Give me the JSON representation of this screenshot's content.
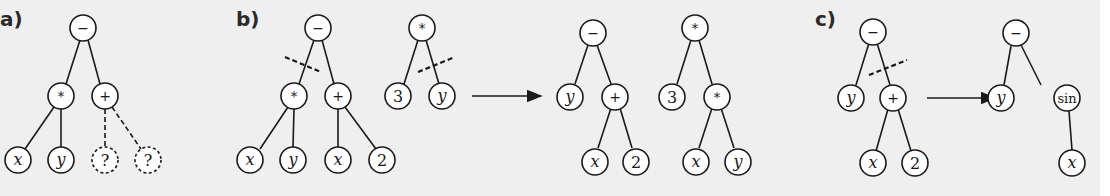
{
  "panels": [
    {
      "label": "a)",
      "description": "Expression tree with incomplete subtree (dashed placeholders)",
      "trees": [
        {
          "root": "−",
          "nodes": [
            {
              "id": "a1",
              "label": "−",
              "type": "operator"
            },
            {
              "id": "a2",
              "label": "*",
              "type": "operator"
            },
            {
              "id": "a3",
              "label": "+",
              "type": "operator"
            },
            {
              "id": "a4",
              "label": "x",
              "type": "variable"
            },
            {
              "id": "a5",
              "label": "y",
              "type": "variable"
            },
            {
              "id": "a6",
              "label": "?",
              "type": "placeholder"
            },
            {
              "id": "a7",
              "label": "?",
              "type": "placeholder"
            }
          ]
        }
      ]
    },
    {
      "label": "b)",
      "description": "Crossover: subtrees swapped at cut points",
      "before": [
        {
          "nodes": [
            {
              "id": "b1",
              "label": "−"
            },
            {
              "id": "b2",
              "label": "*"
            },
            {
              "id": "b3",
              "label": "+"
            },
            {
              "id": "b4",
              "label": "x"
            },
            {
              "id": "b5",
              "label": "y"
            },
            {
              "id": "b6",
              "label": "x"
            },
            {
              "id": "b7",
              "label": "2"
            }
          ]
        },
        {
          "nodes": [
            {
              "id": "b8",
              "label": "*"
            },
            {
              "id": "b9",
              "label": "3"
            },
            {
              "id": "b10",
              "label": "y"
            }
          ]
        }
      ],
      "after": [
        {
          "nodes": [
            {
              "id": "b11",
              "label": "−"
            },
            {
              "id": "b12",
              "label": "y"
            },
            {
              "id": "b13",
              "label": "+"
            },
            {
              "id": "b14",
              "label": "x"
            },
            {
              "id": "b15",
              "label": "2"
            }
          ]
        },
        {
          "nodes": [
            {
              "id": "b16",
              "label": "*"
            },
            {
              "id": "b17",
              "label": "3"
            },
            {
              "id": "b18",
              "label": "*"
            },
            {
              "id": "b19",
              "label": "x"
            },
            {
              "id": "b20",
              "label": "y"
            }
          ]
        }
      ]
    },
    {
      "label": "c)",
      "description": "Mutation: subtree replaced",
      "before": [
        {
          "nodes": [
            {
              "id": "c1",
              "label": "−"
            },
            {
              "id": "c2",
              "label": "y"
            },
            {
              "id": "c3",
              "label": "+"
            },
            {
              "id": "c4",
              "label": "x"
            },
            {
              "id": "c5",
              "label": "2"
            }
          ]
        }
      ],
      "after": [
        {
          "nodes": [
            {
              "id": "c6",
              "label": "−"
            },
            {
              "id": "c7",
              "label": "y"
            },
            {
              "id": "c8",
              "label": "sin"
            },
            {
              "id": "c9",
              "label": "x"
            }
          ]
        }
      ]
    }
  ],
  "labels": {
    "a": "a)",
    "b": "b)",
    "c": "c)",
    "a1": "−",
    "a2": "*",
    "a3": "+",
    "a4": "x",
    "a5": "y",
    "a6": "?",
    "a7": "?",
    "b1": "−",
    "b2": "*",
    "b3": "+",
    "b4": "x",
    "b5": "y",
    "b6": "x",
    "b7": "2",
    "b8": "*",
    "b9": "3",
    "b10": "y",
    "b11": "−",
    "b12": "y",
    "b13": "+",
    "b14": "x",
    "b15": "2",
    "b16": "*",
    "b17": "3",
    "b18": "*",
    "b19": "x",
    "b20": "y",
    "c1": "−",
    "c2": "y",
    "c3": "+",
    "c4": "x",
    "c5": "2",
    "c6": "−",
    "c7": "y",
    "c8": "sin",
    "c9": "x"
  }
}
